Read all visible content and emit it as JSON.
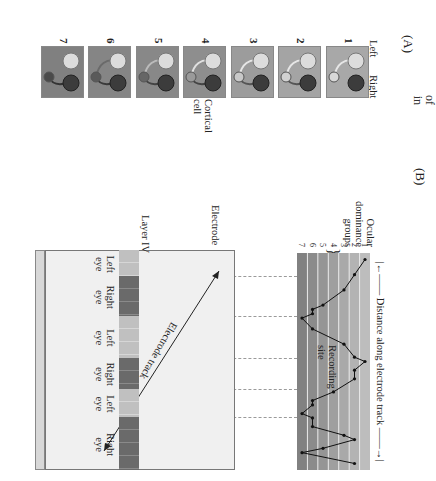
{
  "caption_fragments": [
    "of",
    "in",
    "s,",
    "o",
    "gen-",
    "er-",
    "ft",
    "n-",
    "al",
    "r"
  ],
  "panel_a": {
    "label": "(A)",
    "eye_labels": {
      "left": "Left",
      "right": "Right"
    },
    "cortical_cell_label": "Cortical cell",
    "frames": [
      {
        "num": "1",
        "cell_color": "#d8d8d8",
        "left_link": "#e6e6e6",
        "right_link": null,
        "bg": "#a8a8a8"
      },
      {
        "num": "2",
        "cell_color": "#d2d2d2",
        "left_link": "#e6e6e6",
        "right_link": "#555555",
        "bg": "#a4a4a4"
      },
      {
        "num": "3",
        "cell_color": "#c8c8c8",
        "left_link": "#e6e6e6",
        "right_link": "#555555",
        "bg": "#9c9c9c"
      },
      {
        "num": "4",
        "cell_color": "#9a9a9a",
        "left_link": "#e0e0e0",
        "right_link": "#444444",
        "bg": "#8e8e8e"
      },
      {
        "num": "5",
        "cell_color": "#666666",
        "left_link": "#bbbbbb",
        "right_link": "#444444",
        "bg": "#888888"
      },
      {
        "num": "6",
        "cell_color": "#5a5a5a",
        "left_link": "#6a6a6a",
        "right_link": "#3a3a3a",
        "bg": "#858585"
      },
      {
        "num": "7",
        "cell_color": "#4a4a4a",
        "left_link": null,
        "right_link": "#333333",
        "bg": "#808080"
      }
    ]
  },
  "panel_b": {
    "label": "(B)",
    "ocular_dominance_label": "Ocular dominance groups",
    "distance_label": "Distance along electrode track",
    "recording_site_label": "Recording site",
    "electrode_label": "Electrode",
    "electrode_track_label": "Electrode track",
    "layer_label": "Layer IV",
    "layer_columns": [
      {
        "eye": "Left",
        "sub": "eye",
        "shade": "light"
      },
      {
        "eye": "Right",
        "sub": "eye",
        "shade": "dark"
      },
      {
        "eye": "Left",
        "sub": "eye",
        "shade": "light"
      },
      {
        "eye": "Right",
        "sub": "eye",
        "shade": "dark"
      },
      {
        "eye": "Left",
        "sub": "eye",
        "shade": "light"
      },
      {
        "eye": "Right",
        "sub": "eye",
        "shade": "dark"
      }
    ],
    "group_ticks": [
      "1",
      "2",
      "3",
      "4",
      "5",
      "6",
      "7"
    ]
  },
  "chart_data": {
    "type": "line",
    "xlabel": "Distance along electrode track",
    "ylabel": "Ocular dominance groups",
    "ylim": [
      1,
      7
    ],
    "y_ticks": [
      1,
      2,
      3,
      4,
      5,
      6,
      7
    ],
    "x": [
      0.03,
      0.1,
      0.17,
      0.24,
      0.26,
      0.28,
      0.3,
      0.35,
      0.42,
      0.48,
      0.5,
      0.54,
      0.58,
      0.64,
      0.68,
      0.7,
      0.74,
      0.76,
      0.8,
      0.84,
      0.86,
      0.9,
      0.92,
      0.97
    ],
    "values": [
      1,
      2,
      3,
      5,
      6,
      6,
      7,
      6,
      3,
      2,
      1,
      2,
      2,
      4,
      6,
      6,
      7,
      6,
      6,
      3,
      2,
      5,
      7,
      2
    ],
    "series_note": "Alternating left-eye (group 1-3) and right-eye (group 5-7) dominance along the track"
  }
}
